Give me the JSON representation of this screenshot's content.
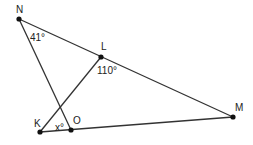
{
  "diagram": {
    "points": {
      "N": {
        "label": "N",
        "x": 19,
        "y": 19
      },
      "L": {
        "label": "L",
        "x": 101,
        "y": 57
      },
      "M": {
        "label": "M",
        "x": 233,
        "y": 117
      },
      "K": {
        "label": "K",
        "x": 40,
        "y": 132
      },
      "O": {
        "label": "O",
        "x": 71,
        "y": 130
      }
    },
    "segments": [
      "NM",
      "NO",
      "KL",
      "KM"
    ],
    "angles": {
      "N": "41°",
      "L": "110°",
      "K": "x°"
    }
  }
}
